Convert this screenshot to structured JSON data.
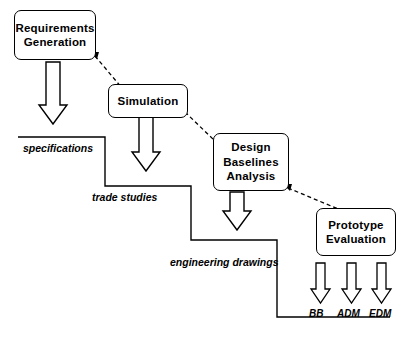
{
  "diagram": {
    "title_visible": false,
    "boxes": [
      {
        "id": "requirements",
        "lines": [
          "Requirements",
          "Generation"
        ]
      },
      {
        "id": "simulation",
        "lines": [
          "Simulation"
        ]
      },
      {
        "id": "design",
        "lines": [
          "Design",
          "Baselines",
          "Analysis"
        ]
      },
      {
        "id": "prototype",
        "lines": [
          "Prototype",
          "Evaluation"
        ]
      }
    ],
    "stair_labels": [
      {
        "id": "specifications",
        "text": "specifications"
      },
      {
        "id": "trade-studies",
        "text": "trade studies"
      },
      {
        "id": "engineering-drawings",
        "text": "engineering drawings"
      }
    ],
    "outputs": [
      {
        "id": "bb",
        "text": "BB"
      },
      {
        "id": "adm",
        "text": "ADM"
      },
      {
        "id": "edm",
        "text": "EDM"
      }
    ],
    "colors": {
      "stroke": "#000000",
      "fill": "#ffffff"
    }
  }
}
